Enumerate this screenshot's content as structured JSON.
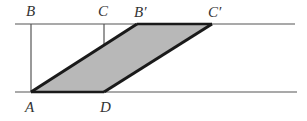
{
  "diagram": {
    "labels": {
      "A": "A",
      "B": "B",
      "C": "C",
      "D": "D",
      "B_prime": "B′",
      "C_prime": "C′"
    },
    "colors": {
      "fill": "#b8b8b8",
      "thick_edge": "#1a1a1a",
      "thin_line": "#555555"
    }
  }
}
